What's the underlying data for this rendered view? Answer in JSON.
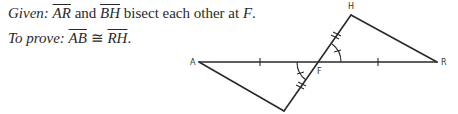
{
  "given": {
    "label": "Given:",
    "seg1": "AR",
    "connector": " and ",
    "seg2": "BH",
    "rest": " bisect each other at ",
    "point": "F",
    "end": "."
  },
  "prove": {
    "label": "To prove:",
    "seg1": "AB",
    "symbol": " ≅ ",
    "seg2": "RH",
    "end": "."
  },
  "diagram": {
    "points": {
      "A": {
        "label": "A",
        "x": 199,
        "y": 62
      },
      "R": {
        "label": "R",
        "x": 437,
        "y": 62
      },
      "H": {
        "label": "H",
        "x": 351,
        "y": 15
      },
      "B": {
        "label": "",
        "x": 284,
        "y": 111
      },
      "F": {
        "label": "F",
        "x": 319,
        "y": 62
      }
    },
    "segments": [
      "AR",
      "BH",
      "AB",
      "HR"
    ],
    "markings": {
      "AF_FR_single_tick": true,
      "BF_FH_double_tick": true,
      "vertical_angles_marked": true
    },
    "line_color": "#2a2a2a"
  }
}
